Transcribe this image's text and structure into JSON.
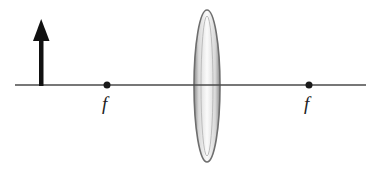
{
  "diagram": {
    "colors": {
      "axis": "#4a4a4a",
      "object_arrow": "#111111",
      "focal_point": "#1a1a1a",
      "lens_edge": "#6e6e6e",
      "lens_fill": "#f4f4f4"
    },
    "optical_axis": {
      "x1": 15,
      "x2": 366,
      "y": 85
    },
    "object_arrow": {
      "x": 41,
      "base_y": 85,
      "tip_y": 19
    },
    "lens": {
      "cx": 207,
      "cy": 86,
      "half_width": 13,
      "half_height": 76
    },
    "focal_points": [
      {
        "label": "f",
        "x": 107,
        "y": 85
      },
      {
        "label": "f",
        "x": 309,
        "y": 85
      }
    ]
  }
}
